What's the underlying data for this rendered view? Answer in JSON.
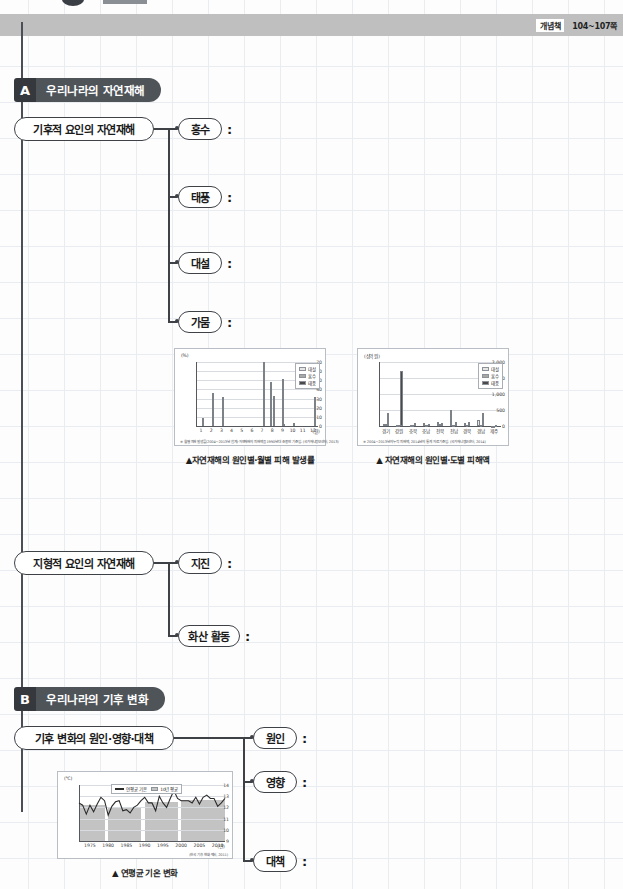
{
  "header": {
    "tag": "개념책",
    "pages": "104~107쪽"
  },
  "sections": [
    {
      "letter": "A",
      "title": "우리나라의 자연재해",
      "branches": [
        {
          "label": "기후적 요인의 자연재해",
          "leaves": [
            "홍수",
            "태풍",
            "대설",
            "가뭄"
          ]
        },
        {
          "label": "지형적 요인의 자연재해",
          "leaves": [
            "지진",
            "화산 활동"
          ]
        }
      ]
    },
    {
      "letter": "B",
      "title": "우리나라의 기후 변화",
      "branches": [
        {
          "label": "기후 변화의 원인·영향·대책",
          "leaves": [
            "원인",
            "영향",
            "대책"
          ]
        }
      ]
    }
  ],
  "colon": ":",
  "figures": [
    {
      "caption": "▲자연재해의 원인별·월별 피해 발생률"
    },
    {
      "caption": "▲ 자연재해의 원인별·도별 피해액"
    },
    {
      "caption": "▲ 연평균 기온 변화"
    }
  ],
  "chart_data": [
    {
      "type": "bar",
      "title": "자연재해의 원인별·월별 피해 발생률",
      "xlabel": "(월)",
      "ylabel": "(%)",
      "yunit": "(%)",
      "ylim": [
        0,
        70
      ],
      "yticks": [
        0,
        10,
        20,
        30,
        40,
        50,
        60,
        70
      ],
      "categories": [
        "1",
        "2",
        "3",
        "4",
        "5",
        "6",
        "7",
        "8",
        "9",
        "10",
        "11",
        "12"
      ],
      "grid": true,
      "legend_position": "top-right",
      "series": [
        {
          "name": "대설",
          "color": "#e6e6e6",
          "values": [
            0,
            0,
            0,
            0,
            0,
            0,
            0,
            48,
            0,
            0,
            0,
            0
          ]
        },
        {
          "name": "홍수",
          "color": "#a8a8a8",
          "values": [
            0,
            0,
            0,
            0,
            0,
            0,
            0,
            0,
            51,
            0,
            0,
            0
          ]
        },
        {
          "name": "태풍",
          "color": "#4a4a4a",
          "values": [
            9,
            36,
            32,
            0,
            0,
            0,
            70,
            33,
            2,
            3,
            0,
            32
          ]
        }
      ],
      "source": "※ 월별 피해 발생률(2004~2013년 합계)·자연재해의 피해액을 1990년대 초·중반 기준임. (국가재난정보센터, 2013)"
    },
    {
      "type": "bar",
      "title": "자연재해의 원인별·도별 피해액",
      "xlabel": "",
      "ylabel": "(십억 원)",
      "yunit": "(십억 원)",
      "ylim": [
        0,
        2000
      ],
      "yticks": [
        0,
        500,
        1000,
        1500,
        2000
      ],
      "categories": [
        "경기",
        "강원",
        "충북",
        "충남",
        "전북",
        "전남",
        "경북",
        "경남",
        "제주"
      ],
      "grid": true,
      "legend_position": "top-right",
      "series": [
        {
          "name": "대설",
          "color": "#e6e6e6",
          "values": [
            60,
            20,
            20,
            90,
            140,
            500,
            90,
            200,
            10
          ]
        },
        {
          "name": "홍수",
          "color": "#a8a8a8",
          "values": [
            60,
            40,
            30,
            40,
            50,
            40,
            40,
            40,
            10
          ]
        },
        {
          "name": "태풍",
          "color": "#4a4a4a",
          "values": [
            420,
            1720,
            80,
            70,
            80,
            140,
            110,
            400,
            20
          ]
        }
      ],
      "source": "※ 2004~2013년의 누적 피해액, 2014년의 통계 자료 기준임. (국가재난정보센터, 2014)"
    },
    {
      "type": "line",
      "title": "연평균 기온 변화",
      "xlabel": "(년)",
      "ylabel": "(℃)",
      "yunit": "(℃)",
      "ylim": [
        9,
        14
      ],
      "yticks": [
        9,
        10,
        11,
        12,
        13,
        14
      ],
      "xticks": [
        "1975",
        "1980",
        "1985",
        "1990",
        "1995",
        "2000",
        "2005",
        "2010"
      ],
      "xlim": [
        1972,
        2012
      ],
      "grid": true,
      "legend_position": "top-center",
      "legend": [
        {
          "name": "연평균 기온",
          "type": "line",
          "color": "#2b2b2b"
        },
        {
          "name": "10년 평균",
          "type": "area",
          "color": "#c3c3c3"
        }
      ],
      "series": [
        {
          "name": "연평균 기온",
          "color": "#2b2b2b",
          "x": [
            1972,
            1973,
            1974,
            1975,
            1976,
            1977,
            1978,
            1979,
            1980,
            1981,
            1982,
            1983,
            1984,
            1985,
            1986,
            1987,
            1988,
            1989,
            1990,
            1991,
            1992,
            1993,
            1994,
            1995,
            1996,
            1997,
            1998,
            1999,
            2000,
            2001,
            2002,
            2003,
            2004,
            2005,
            2006,
            2007,
            2008,
            2009,
            2010,
            2011,
            2012
          ],
          "values": [
            12.4,
            12.2,
            11.4,
            12.2,
            11.6,
            12.3,
            12.9,
            12.6,
            11.3,
            12.1,
            12.5,
            12.6,
            11.7,
            11.8,
            11.5,
            12.0,
            12.2,
            12.6,
            12.9,
            12.4,
            12.4,
            11.7,
            13.0,
            12.4,
            12.0,
            12.8,
            13.5,
            12.8,
            12.6,
            12.6,
            12.6,
            12.4,
            12.9,
            12.3,
            12.9,
            13.1,
            12.8,
            12.8,
            12.1,
            12.4,
            12.8
          ]
        },
        {
          "name": "10년 평균",
          "color": "#c3c3c3",
          "decades": [
            {
              "range": "1972-1979",
              "value": 12.2
            },
            {
              "range": "1980-1989",
              "value": 12.0
            },
            {
              "range": "1990-1999",
              "value": 12.5
            },
            {
              "range": "2000-2012",
              "value": 12.7
            }
          ]
        }
      ],
      "source": "(한국 기후 변화 백서, 2011)"
    }
  ]
}
